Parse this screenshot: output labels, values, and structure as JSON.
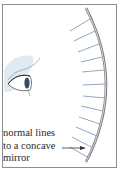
{
  "figure": {
    "caption_lines": [
      "normal lines",
      "to a concave",
      "mirror"
    ],
    "colors": {
      "frame": "#8c8c8c",
      "mirror": "#7a7a7a",
      "normal_lines": "#6f8fb8",
      "arrow": "#333333",
      "eye_shade": "#d6e4ec"
    },
    "normal_line_count": 12
  }
}
